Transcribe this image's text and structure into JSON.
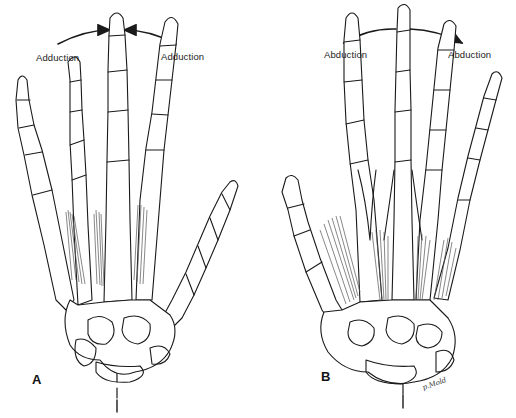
{
  "figure": {
    "panels": [
      {
        "id": "A",
        "letter": "A",
        "motion": "adduction",
        "arrow_direction": "toward-midline",
        "left_label": "Adduction",
        "right_label": "Adduction",
        "muscles": "palmar-interossei",
        "axis_line": "dashed-through-middle-finger"
      },
      {
        "id": "B",
        "letter": "B",
        "motion": "abduction",
        "arrow_direction": "away-from-midline",
        "left_label": "Abduction",
        "right_label": "Abduction",
        "muscles": "dorsal-interossei",
        "axis_line": "dashed-through-middle-finger"
      }
    ],
    "signature": "p.Mold",
    "colors": {
      "ink": "#1a1a1a",
      "muscle": "#555555",
      "background": "#ffffff"
    }
  }
}
